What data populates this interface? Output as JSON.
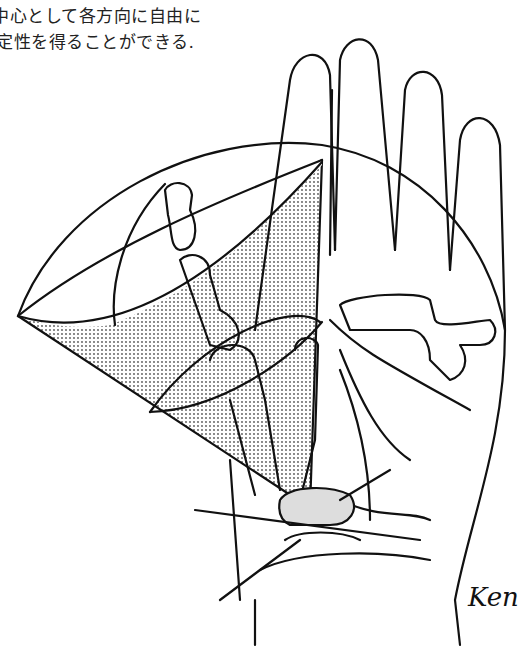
{
  "caption": {
    "line1": "中心として各方向に自由に",
    "line2": "定性を得ることができる."
  },
  "illustration": {
    "subject": "hand-palm-thumb-range-of-motion",
    "shading_color": "#bbbbbb",
    "stroke_color": "#111111"
  },
  "signature": "Ken"
}
